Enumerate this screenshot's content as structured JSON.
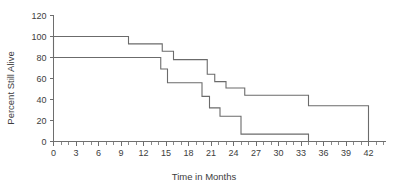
{
  "chart_data": {
    "type": "line",
    "title": "",
    "subtitle": "",
    "xlabel": "Time in Months",
    "ylabel": "Percent Still Alive",
    "xlim": [
      0,
      44
    ],
    "ylim": [
      0,
      120
    ],
    "grid": false,
    "legend": null,
    "x_ticks_major": [
      0,
      3,
      6,
      9,
      12,
      15,
      18,
      21,
      24,
      27,
      30,
      33,
      36,
      39,
      42
    ],
    "x_tick_labels": [
      "0",
      "3",
      "6",
      "9",
      "12",
      "15",
      "18",
      "21",
      "24",
      "27",
      "30",
      "33",
      "36",
      "39",
      "42"
    ],
    "x_minor_tick_interval": 1,
    "y_ticks": [
      0,
      20,
      40,
      60,
      80,
      100,
      120
    ],
    "y_tick_labels": [
      "0",
      "20",
      "40",
      "60",
      "80",
      "100",
      "120"
    ],
    "line_color": "#6b6b6b",
    "axis_color": "#6e6e6e",
    "background_color": "#ffffff",
    "series": [
      {
        "name": "upper-survival-curve",
        "step": "post",
        "x": [
          0,
          10,
          10,
          14.5,
          14.5,
          16,
          16,
          20.5,
          20.5,
          21.5,
          21.5,
          23,
          23,
          25.5,
          25.5,
          34,
          34,
          42,
          42
        ],
        "y": [
          100,
          100,
          93,
          93,
          86,
          86,
          78,
          78,
          64,
          64,
          57,
          57,
          51,
          51,
          44,
          44,
          34,
          34,
          0
        ]
      },
      {
        "name": "lower-survival-curve",
        "step": "post",
        "x": [
          0,
          14.3,
          14.3,
          15.2,
          15.2,
          19.8,
          19.8,
          20.8,
          20.8,
          22.2,
          22.2,
          25,
          25,
          34,
          34
        ],
        "y": [
          80,
          80,
          69,
          69,
          56,
          56,
          43,
          43,
          32,
          32,
          24,
          24,
          7,
          7,
          0
        ]
      }
    ],
    "start_connector": {
      "name": "origin-vertical-connector",
      "x": 0,
      "y_top": 100,
      "y_bottom": 80
    }
  }
}
